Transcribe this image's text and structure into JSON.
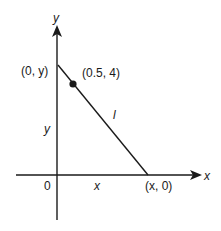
{
  "diagram": {
    "type": "coordinate-geometry",
    "axes": {
      "x_label": "x",
      "y_label": "y",
      "origin_label": "0"
    },
    "points": {
      "y_intercept_label": "(0, y)",
      "given_point_label": "(0.5, 4)",
      "x_intercept_label": "(x, 0)"
    },
    "segments": {
      "line_label": "l",
      "vertical_length_label": "y",
      "horizontal_length_label": "x"
    },
    "colors": {
      "stroke": "#1a1a1a",
      "background": "#ffffff"
    }
  }
}
